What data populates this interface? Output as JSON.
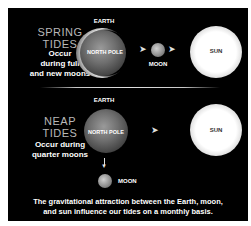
{
  "spring": {
    "title_line1": "SPRING",
    "title_line2": "TIDES",
    "desc_line1": "Occur",
    "desc_line2": "during full",
    "desc_line3": "and new moons",
    "earth_label": "EARTH",
    "pole_label": "NORTH POLE",
    "moon_label": "MOON",
    "sun_label": "SUN",
    "arrow_glyph": "➤"
  },
  "neap": {
    "title_line1": "NEAP",
    "title_line2": "TIDES",
    "desc_line1": "Occur during",
    "desc_line2": "quarter moons",
    "earth_label": "EARTH",
    "pole_label": "NORTH POLE",
    "moon_label": "MOON",
    "sun_label": "SUN",
    "arrow_glyph": "➤",
    "down_arrow_glyph": "▼"
  },
  "caption": {
    "line1": "The gravitational attraction between the Earth, moon,",
    "line2": "and sun influence our tides on a monthly basis."
  },
  "colors": {
    "background": "#000000",
    "title": "#b8b8b8",
    "text": "#ffffff"
  }
}
